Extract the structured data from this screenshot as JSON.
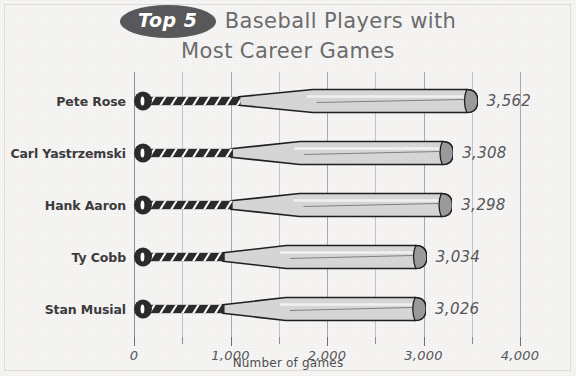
{
  "title": {
    "badge": "Top 5",
    "line1": "Baseball Players with",
    "line2": "Most Career Games"
  },
  "axis": {
    "x_title": "Number of games",
    "tick_labels": [
      "0",
      "1,000",
      "2,000",
      "3,000",
      "4,000"
    ]
  },
  "colors": {
    "background": "#f6f5f3",
    "badge": "#58585a",
    "title_text": "#6b6b6d",
    "label_text": "#3b3b3d",
    "value_text": "#55555a",
    "grid": "#a9a9ab",
    "bat_handle": "#2b2b2d",
    "bat_barrel": "#d5d5d5",
    "bat_outline": "#1f1f21",
    "bat_cap_shade": "#9a9a9c"
  },
  "chart_data": {
    "type": "bar",
    "orientation": "horizontal",
    "title": "Top 5 Baseball Players with Most Career Games",
    "xlabel": "Number of games",
    "ylabel": "",
    "xlim": [
      0,
      4000
    ],
    "xticks": [
      0,
      1000,
      2000,
      3000,
      4000
    ],
    "xticks_minor": [
      500,
      1500,
      2500,
      3500
    ],
    "grid": true,
    "legend": "none",
    "categories": [
      "Pete Rose",
      "Carl Yastrzemski",
      "Hank Aaron",
      "Ty Cobb",
      "Stan Musial"
    ],
    "values": [
      3562,
      3308,
      3298,
      3034,
      3026
    ],
    "value_labels": [
      "3,562",
      "3,308",
      "3,298",
      "3,034",
      "3,026"
    ]
  },
  "rows": [
    {
      "name": "Pete Rose",
      "value": 3562,
      "label": "3,562"
    },
    {
      "name": "Carl Yastrzemski",
      "value": 3308,
      "label": "3,308"
    },
    {
      "name": "Hank Aaron",
      "value": 3298,
      "label": "3,298"
    },
    {
      "name": "Ty Cobb",
      "value": 3034,
      "label": "3,034"
    },
    {
      "name": "Stan Musial",
      "value": 3026,
      "label": "3,026"
    }
  ]
}
